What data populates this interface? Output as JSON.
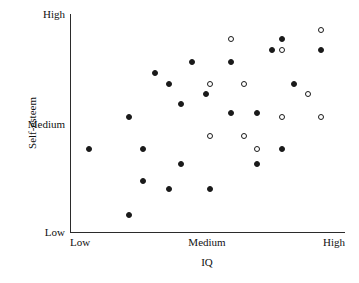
{
  "chart_data": {
    "type": "scatter",
    "title": "",
    "xlabel": "IQ",
    "ylabel": "Self-esteem",
    "grid": false,
    "legend": "none",
    "x_tick_labels": [
      "Low",
      "Medium",
      "High"
    ],
    "y_tick_labels": [
      "Low",
      "Medium",
      "High"
    ],
    "x_tick_positions": [
      0,
      50,
      100
    ],
    "y_tick_positions": [
      0,
      50,
      100
    ],
    "xlim": [
      0,
      100
    ],
    "ylim": [
      0,
      100
    ],
    "series": [
      {
        "name": "filled",
        "marker": "filled-circle",
        "color": "#1a1a1a",
        "points": [
          {
            "x": 3.6,
            "y": 38.1
          },
          {
            "x": 19.3,
            "y": 54.1
          },
          {
            "x": 19.3,
            "y": 5.5
          },
          {
            "x": 24.7,
            "y": 38.1
          },
          {
            "x": 24.7,
            "y": 22.4
          },
          {
            "x": 29.5,
            "y": 75.6
          },
          {
            "x": 34.9,
            "y": 70.1
          },
          {
            "x": 34.9,
            "y": 18.3
          },
          {
            "x": 39.6,
            "y": 60.5
          },
          {
            "x": 39.6,
            "y": 30.6
          },
          {
            "x": 44.0,
            "y": 81.1
          },
          {
            "x": 49.5,
            "y": 65.3
          },
          {
            "x": 51.0,
            "y": 18.3
          },
          {
            "x": 59.6,
            "y": 81.1
          },
          {
            "x": 59.6,
            "y": 55.7
          },
          {
            "x": 69.8,
            "y": 55.7
          },
          {
            "x": 69.8,
            "y": 30.6
          },
          {
            "x": 75.6,
            "y": 87.2
          },
          {
            "x": 79.6,
            "y": 92.7
          },
          {
            "x": 79.6,
            "y": 38.1
          },
          {
            "x": 84.4,
            "y": 70.1
          },
          {
            "x": 94.9,
            "y": 87.2
          }
        ]
      },
      {
        "name": "open",
        "marker": "open-circle",
        "color": "#1a1a1a",
        "points": [
          {
            "x": 51.0,
            "y": 70.1
          },
          {
            "x": 51.0,
            "y": 44.5
          },
          {
            "x": 59.6,
            "y": 92.7
          },
          {
            "x": 64.4,
            "y": 70.1
          },
          {
            "x": 64.4,
            "y": 44.5
          },
          {
            "x": 69.8,
            "y": 38.1
          },
          {
            "x": 79.6,
            "y": 87.2
          },
          {
            "x": 79.6,
            "y": 54.1
          },
          {
            "x": 89.6,
            "y": 65.3
          },
          {
            "x": 94.9,
            "y": 96.8
          },
          {
            "x": 94.9,
            "y": 54.1
          }
        ]
      }
    ]
  }
}
